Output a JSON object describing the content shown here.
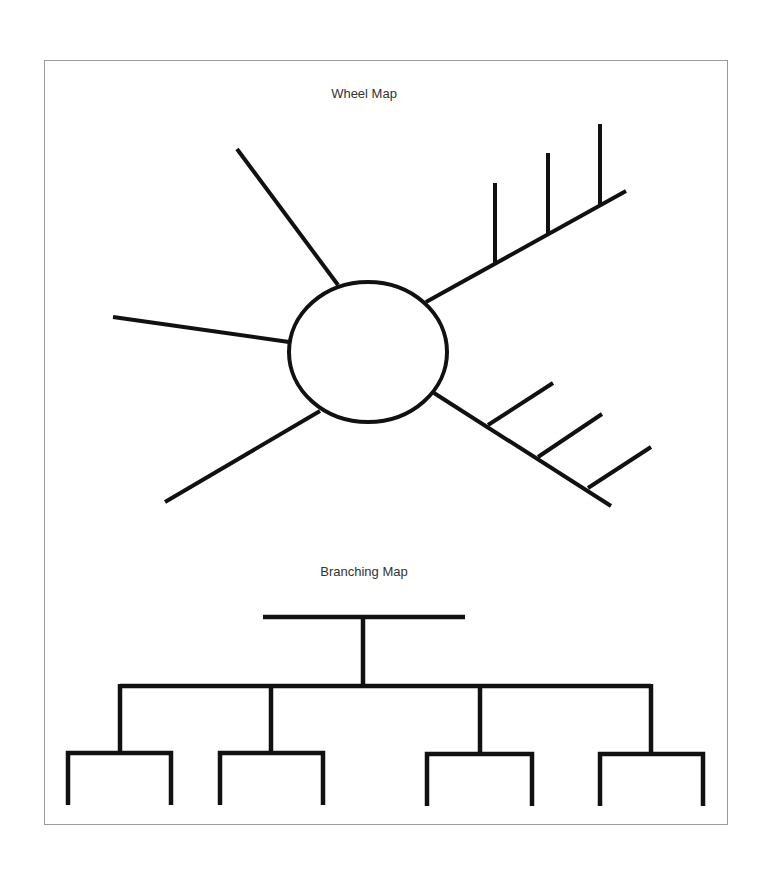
{
  "figure": {
    "border_color": "#9a9a9a",
    "line_color": "#111111",
    "text_color": "#333333"
  },
  "wheel_map": {
    "title": "Wheel Map",
    "hub": {
      "cx": 368,
      "cy": 352,
      "rx": 79,
      "ry": 70
    },
    "spokes": [
      {
        "name": "upper-left",
        "x1": 338,
        "y1": 285,
        "x2": 237,
        "y2": 149
      },
      {
        "name": "left",
        "x1": 289,
        "y1": 342,
        "x2": 113,
        "y2": 317
      },
      {
        "name": "lower-left",
        "x1": 320,
        "y1": 411,
        "x2": 165,
        "y2": 502
      },
      {
        "name": "upper-right",
        "x1": 426,
        "y1": 302,
        "x2": 626,
        "y2": 191
      },
      {
        "name": "lower-right",
        "x1": 434,
        "y1": 393,
        "x2": 611,
        "y2": 506
      }
    ],
    "upper_right_ticks": [
      {
        "x1": 495,
        "y1": 263,
        "x2": 495,
        "y2": 183
      },
      {
        "x1": 548,
        "y1": 233,
        "x2": 548,
        "y2": 153
      },
      {
        "x1": 600,
        "y1": 205,
        "x2": 600,
        "y2": 124
      }
    ],
    "lower_right_branches": [
      {
        "x1": 488,
        "y1": 425,
        "x2": 553,
        "y2": 383
      },
      {
        "x1": 538,
        "y1": 457,
        "x2": 602,
        "y2": 414
      },
      {
        "x1": 588,
        "y1": 488,
        "x2": 651,
        "y2": 447
      }
    ]
  },
  "branching_map": {
    "title": "Branching Map",
    "top_bar": {
      "x1": 263,
      "y1": 617,
      "x2": 465,
      "y2": 617
    },
    "stem": {
      "x1": 363,
      "y1": 617,
      "x2": 363,
      "y2": 686
    },
    "main_bar": {
      "x1": 120,
      "y1": 686,
      "x2": 651,
      "y2": 686
    },
    "drops": [
      {
        "x": 120,
        "y1": 686,
        "y2": 753
      },
      {
        "x": 271,
        "y1": 686,
        "y2": 753
      },
      {
        "x": 480,
        "y1": 686,
        "y2": 754
      },
      {
        "x": 651,
        "y1": 686,
        "y2": 754
      }
    ],
    "sub_groups": [
      {
        "x_left": 68,
        "x_right": 171,
        "y_top": 753,
        "y_bottom": 805
      },
      {
        "x_left": 220,
        "x_right": 323,
        "y_top": 753,
        "y_bottom": 805
      },
      {
        "x_left": 427,
        "x_right": 532,
        "y_top": 754,
        "y_bottom": 806
      },
      {
        "x_left": 600,
        "x_right": 703,
        "y_top": 754,
        "y_bottom": 806
      }
    ]
  }
}
